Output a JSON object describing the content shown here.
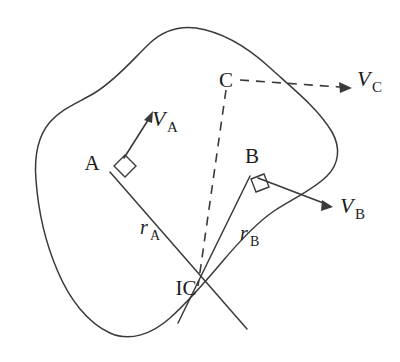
{
  "figure": {
    "type": "kinematics-diagram",
    "background_color": "#ffffff",
    "line_color": "#3a3a3a",
    "text_color": "#1c1c1c"
  },
  "points": {
    "a": {
      "label": "A",
      "x": 100,
      "y": 162
    },
    "b": {
      "label": "B",
      "x": 252,
      "y": 163
    },
    "c": {
      "label": "C",
      "x": 226,
      "y": 80
    },
    "ic": {
      "label": "IC",
      "x": 196,
      "y": 288
    }
  },
  "vectors": [
    {
      "id": "v-a",
      "main": "V",
      "subscript": "A",
      "style": "solid",
      "label_x": 158,
      "label_y": 120,
      "from_x": 124,
      "from_y": 158,
      "to_x": 153,
      "to_y": 113
    },
    {
      "id": "v-b",
      "main": "V",
      "subscript": "B",
      "style": "solid",
      "label_x": 338,
      "label_y": 213,
      "from_x": 258,
      "from_y": 178,
      "to_x": 331,
      "to_y": 206
    },
    {
      "id": "v-c",
      "main": "V",
      "subscript": "C",
      "style": "dashed",
      "label_x": 357,
      "label_y": 86,
      "from_x": 240,
      "from_y": 80,
      "to_x": 352,
      "to_y": 88
    }
  ],
  "radii": [
    {
      "id": "r-a",
      "main": "r",
      "subscript": "A",
      "label_x": 140,
      "label_y": 234,
      "from_x": 110,
      "from_y": 172,
      "to_x": 196,
      "to_y": 288
    },
    {
      "id": "r-b",
      "main": "r",
      "subscript": "B",
      "label_x": 240,
      "label_y": 240,
      "from_x": 250,
      "from_y": 176,
      "to_x": 196,
      "to_y": 288
    }
  ],
  "dashed_connector": {
    "id": "c-to-ic",
    "from_x": 226,
    "from_y": 90,
    "to_x": 198,
    "to_y": 286
  },
  "right_angle_markers": [
    {
      "id": "angle-at-a",
      "at_point": "A"
    },
    {
      "id": "angle-at-b",
      "at_point": "B"
    }
  ]
}
